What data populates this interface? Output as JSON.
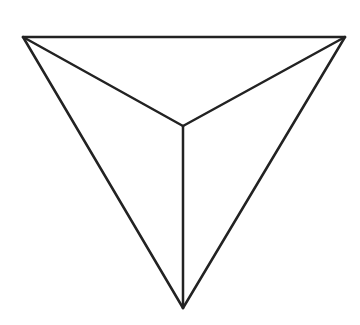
{
  "diagram": {
    "type": "tetrahedron-top-view",
    "background": "#ffffff",
    "stroke_color": "#222222",
    "stroke_width": 2.5,
    "vertices": {
      "top_left": [
        23,
        37
      ],
      "top_right": [
        345,
        37
      ],
      "center": [
        183,
        126
      ],
      "bottom": [
        183,
        308
      ]
    },
    "edges": [
      {
        "name": "edge-top",
        "from": "top_left",
        "to": "top_right"
      },
      {
        "name": "edge-left-outer",
        "from": "top_left",
        "to": "bottom"
      },
      {
        "name": "edge-right-outer",
        "from": "top_right",
        "to": "bottom"
      },
      {
        "name": "edge-left-inner",
        "from": "top_left",
        "to": "center"
      },
      {
        "name": "edge-right-inner",
        "from": "top_right",
        "to": "center"
      },
      {
        "name": "edge-vertical-inner",
        "from": "center",
        "to": "bottom"
      }
    ]
  }
}
